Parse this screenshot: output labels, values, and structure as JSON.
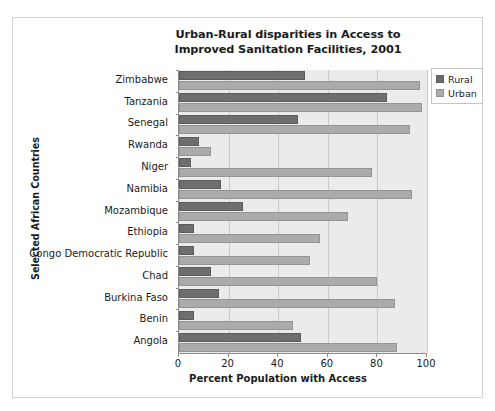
{
  "chart_data": {
    "type": "bar",
    "orientation": "horizontal",
    "title": "Urban-Rural disparities in Access to Improved Sanitation Facilities, 2001",
    "title_line1": "Urban-Rural disparities in Access to",
    "title_line2": "Improved Sanitation Facilities, 2001",
    "xlabel": "Percent Population with Access",
    "ylabel": "Selected African Countries",
    "xlim": [
      0,
      100
    ],
    "xticks": [
      0,
      20,
      40,
      60,
      80,
      100
    ],
    "xticklabels": [
      "0",
      "20",
      "40",
      "60",
      "80",
      "100"
    ],
    "grid": true,
    "legend_position": "upper right",
    "categories": [
      "Zimbabwe",
      "Tanzania",
      "Senegal",
      "Rwanda",
      "Niger",
      "Namibia",
      "Mozambique",
      "Ethiopia",
      "Congo Democratic Republic",
      "Chad",
      "Burkina Faso",
      "Benin",
      "Angola"
    ],
    "series": [
      {
        "name": "Rural",
        "color": "#6e6e6e",
        "values": [
          51,
          84,
          48,
          8,
          5,
          17,
          26,
          6,
          6,
          13,
          16,
          6,
          49
        ]
      },
      {
        "name": "Urban",
        "color": "#ababab",
        "values": [
          97,
          98,
          93,
          13,
          78,
          94,
          68,
          57,
          53,
          80,
          87,
          46,
          88
        ]
      }
    ]
  },
  "legend": {
    "items": [
      {
        "label": "Rural",
        "swatch": "rural-swatch-icon"
      },
      {
        "label": "Urban",
        "swatch": "urban-swatch-icon"
      }
    ]
  }
}
